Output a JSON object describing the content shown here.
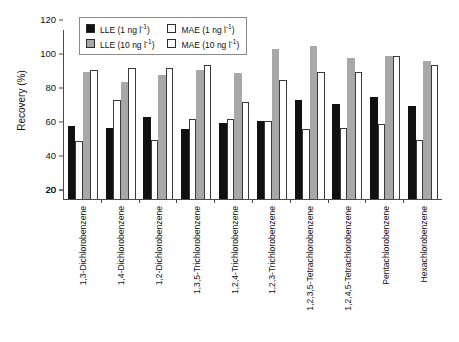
{
  "chart_data": {
    "type": "bar",
    "title": "",
    "xlabel": "",
    "ylabel": "Recovery (%)",
    "ylim": [
      20,
      120
    ],
    "grid": false,
    "legend_position": "top-center",
    "ytick_labels": [
      "120",
      "100",
      "80",
      "60",
      "40",
      "20",
      "20"
    ],
    "ytick_values": [
      120,
      100,
      80,
      60,
      40,
      20,
      0
    ],
    "categories": [
      "1,3-Dichlorobenzene",
      "1,4-Dichlorobenzene",
      "1,2-Dichlorobenzene",
      "1,3,5-Trichlorobenzene",
      "1,2,4-Trichlorobenzene",
      "1,2,3-Trichlorobenzene",
      "1,2,3,5-Tetrachlorobenzene",
      "1,2,4,5-Tetrachlorobenzene",
      "Pentachlorobenzene",
      "Hexachlorobenzene"
    ],
    "series": [
      {
        "name": "LLE (1 ng l-1)",
        "style": "black",
        "color": "#111111",
        "values": [
          63,
          62,
          68,
          61,
          65,
          66,
          78,
          76,
          80,
          75
        ]
      },
      {
        "name": "MAE (1 ng l-1)",
        "style": "white",
        "color": "#ffffff",
        "values": [
          54,
          78,
          55,
          67,
          67,
          66,
          61,
          62,
          64,
          55
        ]
      },
      {
        "name": "LLE (10 ng l-1)",
        "style": "gray",
        "color": "#a8a8a8",
        "values": [
          95,
          89,
          93,
          96,
          94,
          108,
          110,
          103,
          104,
          101
        ]
      },
      {
        "name": "MAE (10 ng l-1)",
        "style": "white",
        "color": "#ffffff",
        "values": [
          96,
          97,
          97,
          99,
          77,
          90,
          95,
          95,
          104,
          99
        ]
      }
    ]
  },
  "legend": {
    "entries": [
      {
        "label_main": "LLE (1 ng l",
        "sup": "-1",
        "label_tail": ")",
        "swatch": "black"
      },
      {
        "label_main": "MAE (1 ng l",
        "sup": "-1",
        "label_tail": ")",
        "swatch": "white"
      },
      {
        "label_main": "LLE (10 ng l",
        "sup": "-1",
        "label_tail": ")",
        "swatch": "gray"
      },
      {
        "label_main": "MAE (10 ng l",
        "sup": "-1",
        "label_tail": ")",
        "swatch": "white"
      }
    ]
  }
}
